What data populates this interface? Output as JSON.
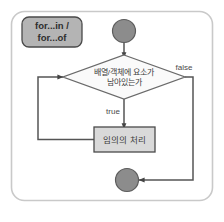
{
  "diagram": {
    "title_tag": {
      "line1": "for...in /",
      "line2": "for...of"
    },
    "nodes": {
      "start": {
        "name": "start-node",
        "shape": "circle"
      },
      "decision": {
        "name": "decision-node",
        "shape": "diamond",
        "line1": "배열/객체에 요소가",
        "line2": "남아있는가"
      },
      "process": {
        "name": "process-node",
        "shape": "rectangle",
        "label": "임의의 처리"
      },
      "end": {
        "name": "end-node",
        "shape": "circle"
      }
    },
    "edges": {
      "true_label": "true",
      "false_label": "false"
    },
    "colors": {
      "frame_border": "#c9c9c9",
      "node_fill_gray": "#8c8c8c",
      "node_stroke_dark": "#4a4a4a",
      "diamond_fill": "#fafafa",
      "process_fill": "#d9d9d9",
      "tag_fill": "#b4b4b4",
      "line": "#555555",
      "text": "#3b3b3b",
      "background": "#ffffff"
    }
  }
}
